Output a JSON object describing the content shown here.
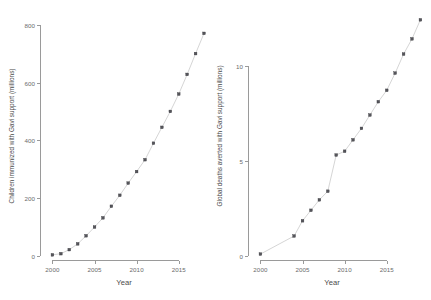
{
  "figure": {
    "panels": [
      {
        "id": "children-immunized",
        "name": "children-immunized-panel",
        "xlabel": "Year",
        "ylabel": "Children immunized with Gavi support (millions)",
        "x_ticks": [
          "2000",
          "2005",
          "2010",
          "2015"
        ],
        "y_ticks": [
          "0",
          "200",
          "400",
          "600",
          "800"
        ]
      },
      {
        "id": "deaths-averted",
        "name": "deaths-averted-panel",
        "xlabel": "Year",
        "ylabel": "Global deaths averted with Gavi support (millions)",
        "x_ticks": [
          "2000",
          "2005",
          "2010",
          "2015"
        ],
        "y_ticks": [
          "0",
          "5",
          "10"
        ]
      }
    ]
  },
  "chart_data": [
    {
      "type": "scatter",
      "title": "",
      "subtitle": "",
      "xlabel": "Year",
      "ylabel": "Children immunized with Gavi support (millions)",
      "xlim": [
        1999,
        2018
      ],
      "ylim": [
        0,
        830
      ],
      "x_ticks": [
        2000,
        2005,
        2010,
        2015
      ],
      "y_ticks": [
        0,
        200,
        400,
        600,
        800
      ],
      "grid": false,
      "legend": "none",
      "x": [
        2000,
        2001,
        2002,
        2003,
        2004,
        2005,
        2006,
        2007,
        2008,
        2009,
        2010,
        2011,
        2012,
        2013,
        2014,
        2015,
        2016,
        2017
      ],
      "values": [
        4,
        8,
        22,
        42,
        70,
        100,
        132,
        172,
        210,
        252,
        292,
        333,
        390,
        445,
        500,
        560,
        628,
        700,
        770
      ],
      "series": [
        {
          "name": "Children immunized with Gavi support (millions)",
          "points": [
            {
              "year": 2000,
              "value": 4
            },
            {
              "year": 2001,
              "value": 8
            },
            {
              "year": 2002,
              "value": 22
            },
            {
              "year": 2003,
              "value": 42
            },
            {
              "year": 2004,
              "value": 70
            },
            {
              "year": 2005,
              "value": 100
            },
            {
              "year": 2006,
              "value": 132
            },
            {
              "year": 2007,
              "value": 172
            },
            {
              "year": 2008,
              "value": 210
            },
            {
              "year": 2009,
              "value": 252
            },
            {
              "year": 2010,
              "value": 292
            },
            {
              "year": 2011,
              "value": 333
            },
            {
              "year": 2012,
              "value": 390
            },
            {
              "year": 2013,
              "value": 445
            },
            {
              "year": 2014,
              "value": 500
            },
            {
              "year": 2015,
              "value": 560
            },
            {
              "year": 2016,
              "value": 628
            },
            {
              "year": 2017,
              "value": 700
            },
            {
              "year": 2018,
              "value": 770
            }
          ]
        }
      ]
    },
    {
      "type": "scatter",
      "title": "",
      "subtitle": "",
      "xlabel": "Year",
      "ylabel": "Global deaths averted with Gavi support (millions)",
      "xlim": [
        1999,
        2018
      ],
      "ylim": [
        0,
        12.6
      ],
      "x_ticks": [
        2000,
        2005,
        2010,
        2015
      ],
      "y_ticks": [
        0,
        5,
        10
      ],
      "grid": false,
      "legend": "none",
      "x": [
        2000,
        2004,
        2005,
        2006,
        2007,
        2008,
        2009,
        2010,
        2011,
        2012,
        2013,
        2014,
        2015,
        2016,
        2017
      ],
      "values": [
        0.1,
        1.05,
        1.85,
        2.4,
        2.95,
        3.4,
        5.3,
        5.5,
        6.1,
        6.7,
        7.4,
        8.1,
        8.7,
        9.6,
        10.6,
        11.4,
        12.4
      ],
      "series": [
        {
          "name": "Global deaths averted with Gavi support (millions)",
          "points": [
            {
              "year": 2000,
              "value": 0.1
            },
            {
              "year": 2004,
              "value": 1.05
            },
            {
              "year": 2005,
              "value": 1.85
            },
            {
              "year": 2006,
              "value": 2.4
            },
            {
              "year": 2007,
              "value": 2.95
            },
            {
              "year": 2008,
              "value": 3.4
            },
            {
              "year": 2009,
              "value": 5.3
            },
            {
              "year": 2010,
              "value": 5.5
            },
            {
              "year": 2011,
              "value": 6.1
            },
            {
              "year": 2012,
              "value": 6.7
            },
            {
              "year": 2013,
              "value": 7.4
            },
            {
              "year": 2014,
              "value": 8.1
            },
            {
              "year": 2015,
              "value": 8.7
            },
            {
              "year": 2016,
              "value": 9.6
            },
            {
              "year": 2017,
              "value": 10.6
            },
            {
              "year": 2018,
              "value": 11.4
            },
            {
              "year": 2019,
              "value": 12.4
            }
          ]
        }
      ]
    }
  ],
  "colors": {
    "point": "#55555b",
    "line": "#b9b9b9",
    "axis": "#9a9a9a",
    "text": "#4a4a4a",
    "background": "#ffffff"
  }
}
